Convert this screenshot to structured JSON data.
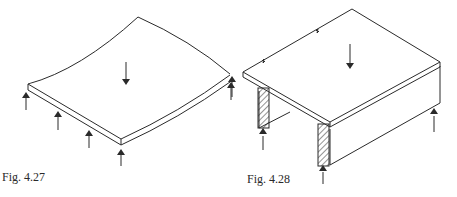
{
  "figures": [
    {
      "id": "fig-4-27",
      "caption": "Fig. 4.27",
      "description": "Isometric slab, curved (deflected) top edges, supported along one edge by a row of upward reaction arrows, with a downward load arrow at centre"
    },
    {
      "id": "fig-4-28",
      "caption": "Fig. 4.28",
      "description": "Isometric slab on two downstand beams with hatched cut ends, upward reactions at beam ends, break lines on back edge, downward load arrow at centre"
    }
  ],
  "colors": {
    "line": "#2a2a2a",
    "background": "#ffffff"
  }
}
